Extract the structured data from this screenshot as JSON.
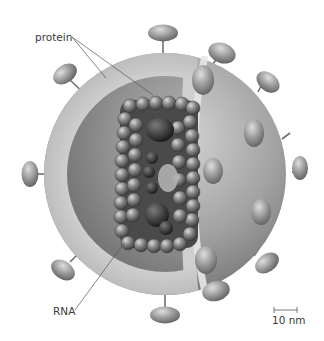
{
  "figure": {
    "labels": {
      "protein": "protein",
      "rna": "RNA",
      "scale_bar": "10 nm"
    },
    "parts": [
      {
        "name": "envelope-surface",
        "icon": "sphere-shell"
      },
      {
        "name": "envelope-cutaway-layer",
        "icon": "shell-layer"
      },
      {
        "name": "matrix-inner-layer",
        "icon": "shell-layer"
      },
      {
        "name": "capsid-core",
        "icon": "protein-beads"
      },
      {
        "name": "rna-genome",
        "icon": "rna-strands"
      },
      {
        "name": "surface-spikes",
        "icon": "glycoprotein-spike",
        "count": 14
      }
    ],
    "colors": {
      "outer_sphere": "#8f8f8f",
      "cut_layer": "#c9c9c9",
      "inner_layer": "#9a9a9a",
      "core_bead": "#7d7d7d",
      "rna_dark": "#3a3a3a",
      "label_text": "#3a3a3a",
      "leader_line": "#555555"
    }
  }
}
